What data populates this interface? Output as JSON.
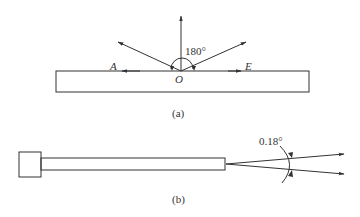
{
  "figure_a": {
    "caption": "(a)",
    "angle_label": "180°",
    "point_o": "O",
    "point_a": "A",
    "point_e": "E"
  },
  "figure_b": {
    "caption": "(b)",
    "angle_label": "0.18°"
  }
}
